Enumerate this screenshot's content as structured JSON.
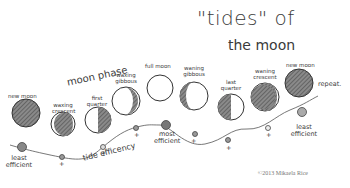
{
  "title": {
    "line1": "\"tides\" of",
    "line2": "the moon"
  },
  "moon_phase_label": "moon phase",
  "phases": [
    {
      "label": "new moon",
      "shade": "full"
    },
    {
      "label": "waxing crescent",
      "shade": "left-dark-most"
    },
    {
      "label": "first quarter",
      "shade": "right-half"
    },
    {
      "label": "waxing gibbous",
      "shade": "left-sliver"
    },
    {
      "label": "full moon",
      "shade": "none"
    },
    {
      "label": "waning gibbous",
      "shade": "left-sliver"
    },
    {
      "label": "last quarter",
      "shade": "left-half"
    },
    {
      "label": "waning crescent",
      "shade": "mostly-dark"
    },
    {
      "label": "new moon",
      "shade": "full"
    }
  ],
  "repeat_label": "repeat.",
  "tide_curve": {
    "label": "tide efficency",
    "markers": [
      {
        "label": "least efficient"
      },
      {
        "label": "+"
      },
      {
        "label": "+"
      },
      {
        "label": "+"
      },
      {
        "label": "most efficient"
      },
      {
        "label": "+"
      },
      {
        "label": "+"
      },
      {
        "label": "+"
      },
      {
        "label": "least efficient"
      }
    ]
  },
  "credit": "©2013 Mikaela Rice"
}
